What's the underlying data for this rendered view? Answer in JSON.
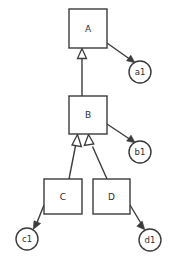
{
  "diagram": {
    "type": "uml-class-hierarchy",
    "background_color": "#ffffff",
    "stroke_color": "#3b3b3b",
    "text_color": "#2e2e2e",
    "nodes": [
      {
        "id": "A",
        "label": "A",
        "shape": "rectangle",
        "x": 69,
        "y": 9,
        "w": 38,
        "h": 39
      },
      {
        "id": "B",
        "label": "B",
        "shape": "rectangle",
        "x": 69,
        "y": 96,
        "w": 38,
        "h": 38
      },
      {
        "id": "C",
        "label": "C",
        "shape": "rectangle",
        "x": 44,
        "y": 179,
        "w": 38,
        "h": 35
      },
      {
        "id": "D",
        "label": "D",
        "shape": "rectangle",
        "x": 93,
        "y": 179,
        "w": 37,
        "h": 35
      },
      {
        "id": "a1",
        "label": "a1",
        "shape": "circle",
        "cx": 140,
        "cy": 72,
        "r": 11
      },
      {
        "id": "b1",
        "label": "b1",
        "shape": "circle",
        "cx": 140,
        "cy": 152,
        "r": 11
      },
      {
        "id": "c1",
        "label": "c1",
        "shape": "circle",
        "cx": 27,
        "cy": 239,
        "r": 11
      },
      {
        "id": "d1",
        "label": "d1",
        "shape": "circle",
        "cx": 150,
        "cy": 240,
        "r": 11
      }
    ],
    "edges": [
      {
        "id": "B-to-A",
        "from": "B",
        "to": "A",
        "arrow": "hollow-triangle"
      },
      {
        "id": "C-to-B",
        "from": "C",
        "to": "B",
        "arrow": "hollow-triangle"
      },
      {
        "id": "D-to-B",
        "from": "D",
        "to": "B",
        "arrow": "hollow-triangle"
      },
      {
        "id": "A-to-a1",
        "from": "A",
        "to": "a1",
        "arrow": "solid"
      },
      {
        "id": "B-to-b1",
        "from": "B",
        "to": "b1",
        "arrow": "solid"
      },
      {
        "id": "C-to-c1",
        "from": "C",
        "to": "c1",
        "arrow": "solid"
      },
      {
        "id": "D-to-d1",
        "from": "D",
        "to": "d1",
        "arrow": "solid"
      }
    ]
  }
}
